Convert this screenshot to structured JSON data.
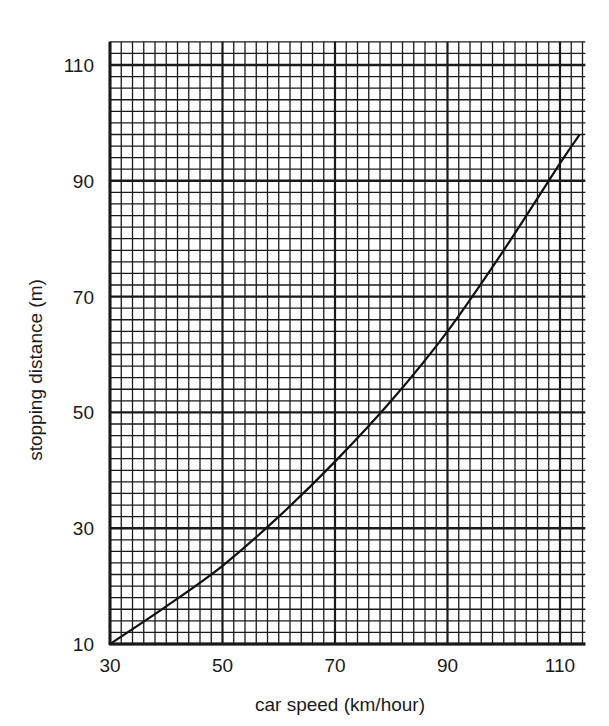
{
  "chart_data": {
    "type": "line",
    "title": "",
    "xlabel": "car speed (km/hour)",
    "ylabel": "stopping distance (m)",
    "xlim": [
      30,
      114.5
    ],
    "ylim": [
      10,
      114
    ],
    "x_ticks": [
      30,
      50,
      70,
      90,
      110
    ],
    "y_ticks": [
      10,
      30,
      50,
      70,
      90,
      110
    ],
    "grid": {
      "on": true,
      "minor_step_x": 2,
      "minor_step_y": 2,
      "major_step_x": 20,
      "major_step_y": 20,
      "style": "graph paper"
    },
    "legend": null,
    "series": [
      {
        "name": "stopping distance",
        "x": [
          30,
          40,
          50,
          60,
          70,
          80,
          90,
          100,
          110,
          113.5
        ],
        "y": [
          10,
          16.5,
          23.5,
          32,
          41.5,
          52,
          64,
          78,
          93,
          98
        ]
      }
    ]
  },
  "colors": {
    "line": "#111111",
    "grid": "#1a1a1a",
    "background": "#ffffff"
  }
}
